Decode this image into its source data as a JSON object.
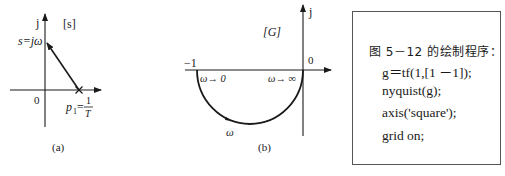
{
  "figure_a": {
    "axis_j_label": "j",
    "plane_label": "[s]",
    "point_label": "s=jω",
    "origin_label": "0",
    "pole_label_p": "p",
    "pole_label_sub": "1",
    "pole_label_eq": "=",
    "pole_label_num": "1",
    "pole_label_den": "T",
    "caption": "(a)"
  },
  "figure_b": {
    "axis_j_label": "j",
    "plane_label": "[G]",
    "minus_one_label": "−1",
    "origin_label": "0",
    "omega_to_zero": "ω→ 0",
    "omega_to_inf": "ω→ ∞",
    "omega_label": "ω",
    "caption": "(b)"
  },
  "code_panel": {
    "title": "图 5－12 的绘制程序：",
    "lines": [
      "g＝tf(1,[1  －1]);",
      "nyquist(g);",
      "axis('square');",
      "grid on;"
    ]
  },
  "colors": {
    "ink": "#1a1a1a",
    "background": "#ffffff",
    "border": "#555555"
  }
}
